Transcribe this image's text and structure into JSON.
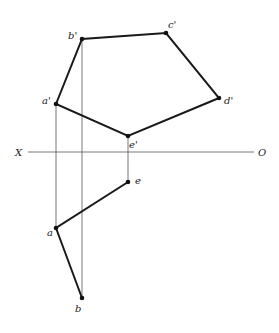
{
  "diagram": {
    "axis": {
      "left_label": "X",
      "right_label": "O"
    },
    "front_view": {
      "points": {
        "a_prime": {
          "label": "a'",
          "x": 56,
          "y": 104
        },
        "b_prime": {
          "label": "b'",
          "x": 82,
          "y": 39
        },
        "c_prime": {
          "label": "c'",
          "x": 166,
          "y": 33
        },
        "d_prime": {
          "label": "d'",
          "x": 219,
          "y": 98
        },
        "e_prime": {
          "label": "e'",
          "x": 128,
          "y": 136
        }
      },
      "edges": [
        [
          "a'",
          "b'"
        ],
        [
          "b'",
          "c'"
        ],
        [
          "c'",
          "d'"
        ],
        [
          "d'",
          "e'"
        ],
        [
          "e'",
          "a'"
        ]
      ]
    },
    "top_view": {
      "points": {
        "a": {
          "label": "a",
          "x": 56,
          "y": 228
        },
        "b": {
          "label": "b",
          "x": 82,
          "y": 298
        },
        "e": {
          "label": "e",
          "x": 128,
          "y": 182
        }
      },
      "edges": [
        [
          "e",
          "a"
        ],
        [
          "a",
          "b"
        ]
      ]
    },
    "projection_lines": [
      [
        "a'",
        "a"
      ],
      [
        "b'",
        "b"
      ],
      [
        "e'",
        "e"
      ]
    ]
  }
}
